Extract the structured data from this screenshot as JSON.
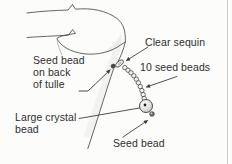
{
  "diagram": {
    "labels": {
      "clear_sequin": "Clear sequin",
      "ten_seed_beads": "10 seed beads",
      "seed_bead_on_back": [
        "Seed bead",
        "on back",
        "of tulle"
      ],
      "large_crystal_bead": [
        "Large crystal",
        "bead"
      ],
      "seed_bead": "Seed bead"
    },
    "bead_count": 10,
    "colors": {
      "background": "#fcfcfb",
      "line_art": "#3d3d3d",
      "text": "#2e2e2e",
      "bead_fill": "#f2f2f2",
      "fabric_shading": "#e8e8e8",
      "page_edge_line": "#cccccc"
    }
  }
}
